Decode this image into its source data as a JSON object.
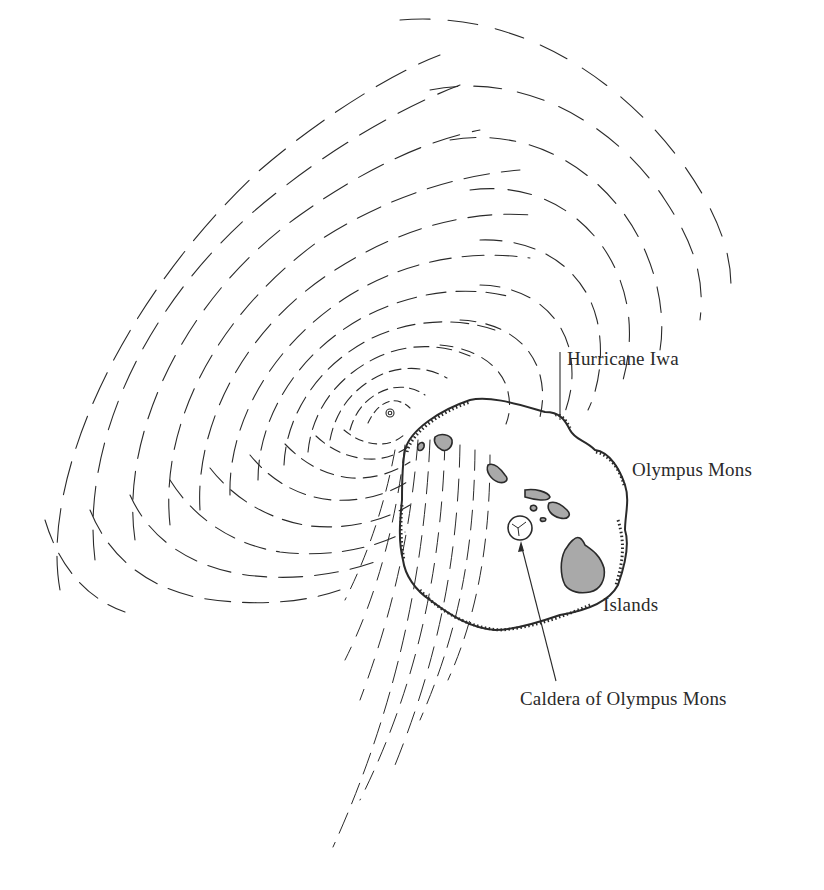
{
  "figure": {
    "colors": {
      "background": "#ffffff",
      "ink": "#2a2a2a",
      "island_fill": "#a9a9a9"
    }
  },
  "labels": {
    "hurricane": "Hurricane Iwa",
    "olympus": "Olympus Mons",
    "islands": "Islands",
    "caldera": "Caldera of Olympus Mons"
  },
  "leaders": {
    "hurricane": {
      "x1": 560,
      "y1": 352,
      "x2": 560,
      "y2": 420
    },
    "caldera": {
      "x1": 521,
      "y1": 552,
      "x2": 556,
      "y2": 681
    }
  }
}
